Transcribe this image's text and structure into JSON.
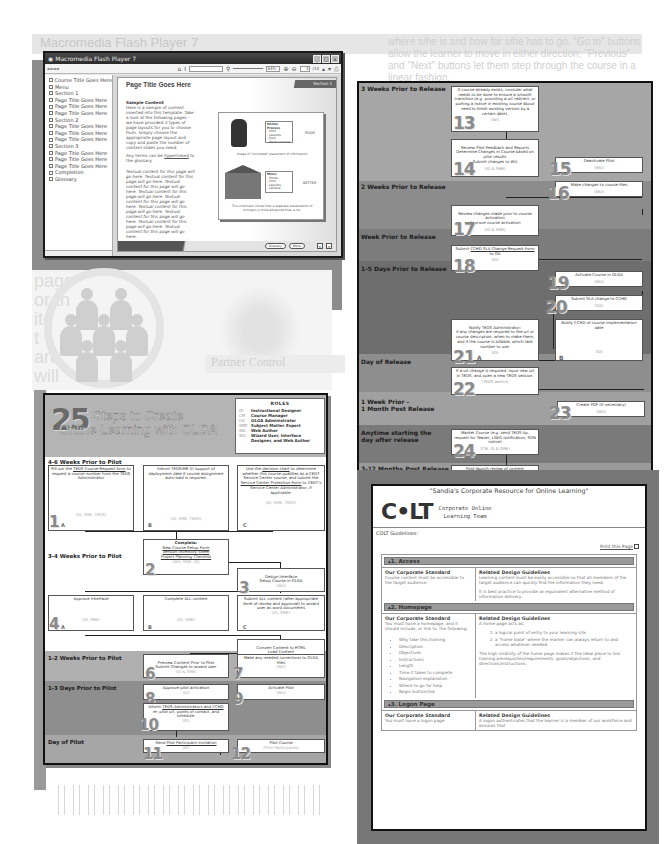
{
  "background": {
    "faded_title": "Macromedia Flash Player 7",
    "right_text": "where s/he is and how far s/he has to go. \"Go to\" buttons allow the learner to move in either direction; \"Previous\" and \"Next\" buttons let them step through the course in a linear fashion.",
    "left_words": [
      "page",
      "or th",
      "ite",
      "t",
      "are",
      "will"
    ],
    "partner_label": "Partner Control",
    "right_words": [
      "ss.",
      "ment",
      "ling",
      "cen"
    ]
  },
  "flash_player": {
    "title": "Macromedia Flash Player 7",
    "window_buttons": [
      "_",
      "□",
      "x"
    ],
    "toolbar": {
      "zoom": "64%",
      "page": "4",
      "page_total": "/14"
    },
    "sidebar_items": [
      "Course Title Goes Here",
      "Menu",
      "Section 1",
      "Page Title Goes Here",
      "Page Title Goes Here",
      "Page Title Goes Here",
      "Section 2",
      "Page Title Goes Here",
      "Page Title Goes Here",
      "Page Title Goes Here",
      "Section 3",
      "Page Title Goes Here",
      "Page Title Goes Here",
      "Page Title Goes Here",
      "Completion",
      "Glossary"
    ],
    "page": {
      "title": "Page Title Goes Here",
      "section_tab": "Section 1",
      "content_heading": "Sample Content",
      "paragraph1": "Here is a sample of content inserted into this template. Take a look at the following pages - we have provided 3 types of page layouts for you to choose from. Simply choose the appropriate page layout and copy and paste the number of content slides you need.",
      "paragraph2_prefix": "Any terms can be ",
      "paragraph2_link": "hyperlinked",
      "paragraph2_suffix": " to the glossary.",
      "paragraph3": "Textual content for this page will go here. Textual content for this page will go here. Textual content for this page will go here. Textual content for this page will go here. Textual content for this page will go here. Textual content for this page will go here. Textual content for this page will go here. Textual content for this page will go here. Textual content for this page will go here.",
      "figure": {
        "menu1_title": "Online Process",
        "menu1_items": [
          "- Intro",
          "- Lessons",
          "- Quiz",
          "- Word Location"
        ],
        "label_poor": "POOR",
        "caption1": "Image of \"Uncooked\" placement of information",
        "menu2_title": "Menu",
        "menu2_items": [
          "- Home",
          "- Intro",
          "- Lessons",
          "- Lecture"
        ],
        "label_better": "BETTER",
        "caption2": "This schematic shows how a separate presentation of concepts is more advanced than a list."
      },
      "footer_buttons": [
        "Glossary",
        "Menu",
        "<",
        ">"
      ]
    }
  },
  "release_chart": {
    "bands": [
      {
        "label": "3 Weeks Prior to Release",
        "color": "#a6a6a6"
      },
      {
        "label": "2 Weeks Prior to Release",
        "color": "#8c8c8c"
      },
      {
        "label": "Week Prior to Release",
        "color": "#7c7c7c"
      },
      {
        "label": "1-5 Days Prior to Release",
        "color": "#6e6e6e"
      },
      {
        "label": "Day of Release",
        "color": "#8e8e8e"
      },
      {
        "label": "1 Week Prior -\n1 Month Post Release",
        "color": "#a0a0a0"
      },
      {
        "label": "Anytime starting the\nday after release",
        "color": "#7a7a7a"
      },
      {
        "label": "3-12 Months Post Release",
        "color": "#9a9a9a"
      }
    ],
    "steps": [
      {
        "num": "13",
        "text": "If course already exists, consider what needs to be done to ensure a smooth transition (e.g. providing a url redirect, or putting a notice in existing course about need to finish existing version by a certain date).",
        "who": "(WI)"
      },
      {
        "num": "14",
        "text": "Review Pilot Feedback and Reports\nDetermine Changes in Course based on pilot results\nSubmit changes to WU",
        "who": "(ID & SME)"
      },
      {
        "num": "15",
        "text": "Deactivate Pilot",
        "who": "(WU)"
      },
      {
        "num": "16",
        "text": "Make changes to course files",
        "who": "(WU)"
      },
      {
        "num": "17",
        "text": "Review changes made prior to course activation\nApprove course activation",
        "who": "(ID & SME)"
      },
      {
        "num": "18",
        "text_prefix": "Submit ",
        "link": "CCHD SLA Change Request Form",
        "text_suffix": " to OA",
        "who": "(ID)"
      },
      {
        "num": "19",
        "text": "Activate Course in OLGA",
        "who": "(WU)"
      },
      {
        "num": "20",
        "text": "Submit SLA change to CCHD",
        "who": "(OA)"
      },
      {
        "num": "21",
        "sub": "A",
        "text": "Notify TEDS Administrator:\nif any changes are required to the url or course description, when to make them, and if the course is billable, which task number to use.",
        "who": "(ID)"
      },
      {
        "num": "",
        "sub": "B",
        "text": "Notify CCHD of course implementation date",
        "who": "(ID)"
      },
      {
        "num": "22",
        "text": "If a url change is required: input new url in TEDS, and open a new TEDS session.",
        "who": "(TEDS admin)"
      },
      {
        "num": "23",
        "text": "Create PDF (if necessary)",
        "who": "(WU)"
      },
      {
        "num": "24",
        "text": "Market Course (e.g. send TEDS tip, request for Teaser, LIWG notification, SDN notice)",
        "who": "(CM, ID & SME)"
      },
      {
        "num": "25",
        "text": "Post-launch review of content",
        "who": ""
      }
    ]
  },
  "steps_chart": {
    "big_number": "25",
    "title_line1": "Steps to Create",
    "title_line2": "Online Learning with OLGA",
    "roles_title": "ROLES",
    "roles": [
      {
        "code": "ID",
        "name": "Instructional Designer"
      },
      {
        "code": "CM",
        "name": "Course Manager"
      },
      {
        "code": "OA",
        "name": "OLGA Administrator"
      },
      {
        "code": "SME",
        "name": "Subject Matter Expert"
      },
      {
        "code": "WA",
        "name": "Web Author"
      },
      {
        "code": "WU",
        "name": "Wizard User, Interface"
      },
      {
        "code": "",
        "name": "Designer, and Web Author"
      }
    ],
    "bands": [
      {
        "label": "4-6 Weeks Prior to Pilot",
        "color": "#ffffff"
      },
      {
        "label": "3-4 Weeks Prior to Pilot",
        "color": "#ffffff"
      },
      {
        "label": "2-3 Weeks Prior to Pilot",
        "color": "#ffffff"
      },
      {
        "label": "1-2 Weeks Prior to Pilot",
        "color": "#b0b0b0"
      },
      {
        "label": "1-3 Days Prior to Pilot",
        "color": "#8e8e8e"
      },
      {
        "label": "Day of Pilot",
        "color": "#a6a6a6"
      }
    ],
    "steps": [
      {
        "num": "1",
        "sub": "A",
        "text_prefix": "Fill out the ",
        "link": "TEDS Course Request form",
        "text_suffix": " to request a course number from the TEDS Administrator",
        "who": "(ID, SME, TEDS)"
      },
      {
        "num": "",
        "sub": "B",
        "text": "Inform TEDS/HR (I) support of deployment date if course assignment auto-load is required.",
        "who": "(ID, SME, TEDS)"
      },
      {
        "num": "",
        "sub": "C",
        "text_prefix": "Use the ",
        "link": "decision chart",
        "text_mid": " to determine whether this course qualifies as a CEDT Service Center course, and submit the ",
        "link2": "Service Center Protection Form",
        "text_suffix": " to CEDT's Service Center Administrator, if applicable.",
        "who": "(ID, SME, TEDS)"
      },
      {
        "num": "2",
        "heading": "Complete:",
        "links": [
          "New Course Setup Form",
          "Version Inventory Sheet",
          "Project Planning Checklist"
        ],
        "who": "(WU, SME, ID)"
      },
      {
        "num": "3",
        "text": "Design Interface\nSetup Course in OLGA",
        "who": "(WU)"
      },
      {
        "num": "4",
        "sub": "A",
        "text": "Approve Interface",
        "who": "(ID, SME)"
      },
      {
        "num": "",
        "sub": "B",
        "text": "Complete ALL content",
        "who": "(ID, SME)"
      },
      {
        "num": "",
        "sub": "C",
        "text": "Submit ALL content (after appropriate level of review and approval) to wizard user as word documents",
        "who": "(ID, SME)"
      },
      {
        "num": "5",
        "text": "Convert Content to HTML\nLoad Content\nTest on PC, MAC & Unix platforms",
        "who": "(WU)"
      },
      {
        "num": "6",
        "text": "Preview Content Prior to Pilot\nSubmit Changes to wizard user",
        "who": "(ID & SME)"
      },
      {
        "num": "7",
        "text": "Make any needed corrections to OLGA files",
        "who": "(WU)"
      },
      {
        "num": "8",
        "text": "Approve pilot activation",
        "who": "(ID)"
      },
      {
        "num": "9",
        "text": "Activate Pilot",
        "who": "(WU)"
      },
      {
        "num": "10",
        "text_prefix": "Inform ",
        "link": "TEDS Administrators and CCHD",
        "text_suffix": " re: pilot url, points of contact, and schedule.",
        "who": "(ID)"
      },
      {
        "num": "11",
        "text_prefix": "Send ",
        "link": "Pilot Participant Invitation",
        "text_suffix": "",
        "who": "(ID)"
      },
      {
        "num": "12",
        "text": "Pilot Course",
        "who": "(Pilot Participants)"
      }
    ]
  },
  "colt_page": {
    "tagline": "\"Sandia's Corporate Resource for Online Learning\"",
    "logo": "C•LT",
    "logo_line1": "Corporate Online",
    "logo_line2": "Learning Team",
    "guidelines_label": "COLT Guidelines:",
    "print_link": "Print this Page",
    "sections": [
      {
        "title": "1. Access",
        "standard_head": "Our Corporate Standard",
        "standard_text": "Course content must be accessible to the target audience.",
        "guide_head": "Related Design Guidelines",
        "guide_text": "Learning content must be easily accessible so that all members of the target audience can quickly find the information they need.",
        "guide_text2": "It is best practice to provide an equivalent alternative method of information delivery."
      },
      {
        "title": "2. Homepage",
        "standard_head": "Our Corporate Standard",
        "standard_text": "You must have a homepage, and it should include, or link to, the following:",
        "standard_list": [
          "Why take this training",
          "Description",
          "Objectives",
          "Instructions",
          "Length",
          "Time it takes to complete",
          "Navigation explanation",
          "Where to go for help",
          "Begin button/link"
        ],
        "guide_head": "Related Design Guidelines",
        "guide_text": "A home page acts as:",
        "guide_list": [
          "a logical point of entry to your learning site",
          "a \"home base\" where the learner can always return to and access whatever needed"
        ],
        "guide_text2": "The high visibility of the home page makes it the ideal place to link training prerequisites/requirements, goals/objectives, and directions/instructions."
      },
      {
        "title": "3. Logon Page",
        "standard_head": "Our Corporate Standard",
        "standard_text": "You must have a logon page.",
        "guide_head": "Related Design Guidelines",
        "guide_text": "A logon authenticates that the learner is a member of our workforce and ensures that"
      }
    ]
  }
}
